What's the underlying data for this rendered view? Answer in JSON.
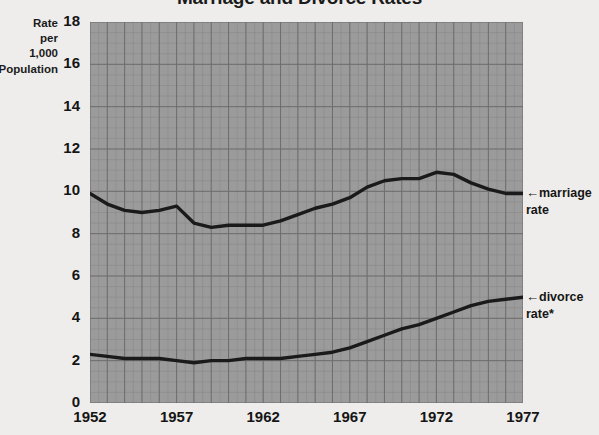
{
  "chart_data": {
    "type": "line",
    "title": "Marriage and Divorce Rates",
    "ylabel": "Rate\nper\n1,000\nPopulation",
    "xlabel": "",
    "xlim": [
      1952,
      1977
    ],
    "ylim": [
      0,
      18
    ],
    "ytick_labels": [
      "18",
      "16",
      "14",
      "12",
      "10",
      "8",
      "6",
      "4",
      "2",
      "0"
    ],
    "ytick_values": [
      18,
      16,
      14,
      12,
      10,
      8,
      6,
      4,
      2,
      0
    ],
    "xtick_labels": [
      "1952",
      "1957",
      "1962",
      "1967",
      "1972",
      "1977"
    ],
    "xtick_values": [
      1952,
      1957,
      1962,
      1967,
      1972,
      1977
    ],
    "grid": true,
    "grid_minor": true,
    "legend_position": "right-inline-annotations",
    "x": [
      1952,
      1953,
      1954,
      1955,
      1956,
      1957,
      1958,
      1959,
      1960,
      1961,
      1962,
      1963,
      1964,
      1965,
      1966,
      1967,
      1968,
      1969,
      1970,
      1971,
      1972,
      1973,
      1974,
      1975,
      1976,
      1977
    ],
    "series": [
      {
        "name": "marriage rate",
        "annotation": "marriage\nrate",
        "color": "#1a1a1a",
        "values": [
          9.9,
          9.4,
          9.1,
          9.0,
          9.1,
          9.3,
          8.5,
          8.3,
          8.4,
          8.4,
          8.4,
          8.6,
          8.9,
          9.2,
          9.4,
          9.7,
          10.2,
          10.5,
          10.6,
          10.6,
          10.9,
          10.8,
          10.4,
          10.1,
          9.9,
          9.9
        ]
      },
      {
        "name": "divorce rate",
        "annotation": "divorce\nrate*",
        "color": "#1a1a1a",
        "values": [
          2.3,
          2.2,
          2.1,
          2.1,
          2.1,
          2.0,
          1.9,
          2.0,
          2.0,
          2.1,
          2.1,
          2.1,
          2.2,
          2.3,
          2.4,
          2.6,
          2.9,
          3.2,
          3.5,
          3.7,
          4.0,
          4.3,
          4.6,
          4.8,
          4.9,
          5.0
        ]
      }
    ]
  },
  "annotations": {
    "marriage": "marriage\nrate",
    "divorce": "divorce\nrate*",
    "arrow_glyph": "←"
  },
  "colors": {
    "page_background": "#eeedeb",
    "plot_background": "#9b9b9b",
    "grid_major": "#6e6e6e",
    "grid_minor": "#8a8a8a",
    "line": "#1a1a1a",
    "text": "#151515"
  }
}
